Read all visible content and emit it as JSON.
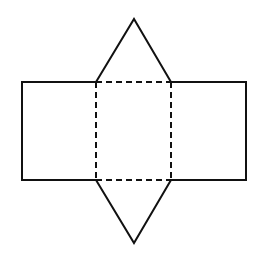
{
  "diagram": {
    "type": "net-of-triangular-prism",
    "stroke_color": "#111111",
    "background": "#ffffff",
    "points": {
      "top_apex": [
        134,
        19
      ],
      "bottom_apex": [
        134,
        243
      ],
      "outer_left": 22,
      "outer_right": 246,
      "inner_left": 96,
      "inner_right": 171,
      "top": 82,
      "bottom": 180
    },
    "faces": [
      {
        "name": "top-triangle",
        "style": "solid"
      },
      {
        "name": "left-rectangle",
        "style": "solid"
      },
      {
        "name": "center-rectangle",
        "style": "dashed-fold"
      },
      {
        "name": "right-rectangle",
        "style": "solid"
      },
      {
        "name": "bottom-triangle",
        "style": "solid"
      }
    ]
  }
}
